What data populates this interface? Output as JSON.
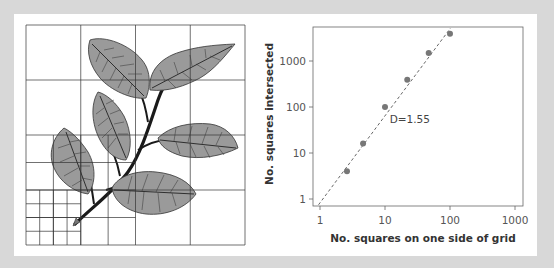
{
  "figure": {
    "frame_color": "#d8d8d8",
    "panel_color": "#ffffff"
  },
  "diagram": {
    "leaf_fill": "#9a9a9a",
    "grid": {
      "major_divisions": 4,
      "medium_region": "lower-left quadrant subdivided 4x4",
      "fine_region": "lower-left quarter of medium region subdivided 4x4"
    }
  },
  "chart_data": {
    "type": "scatter",
    "title": "",
    "xlabel": "No. squares on one side of grid",
    "ylabel": "No. squares intersected",
    "xscale": "log",
    "yscale": "log",
    "xlim": [
      0.8,
      1300
    ],
    "ylim": [
      0.7,
      5500
    ],
    "xticks": [
      1,
      10,
      100,
      1000
    ],
    "xtick_labels": [
      "1",
      "10",
      "100",
      "1000"
    ],
    "yticks": [
      1,
      10,
      100,
      1000
    ],
    "ytick_labels": [
      "1",
      "10",
      "100",
      "1000"
    ],
    "grid": false,
    "legend": null,
    "series": [
      {
        "name": "box counts",
        "x": [
          2.6,
          4.6,
          10,
          22,
          47,
          100
        ],
        "y": [
          4,
          16,
          100,
          390,
          1500,
          3900
        ],
        "marker": "circle",
        "color": "#777777"
      }
    ],
    "fit_line": {
      "style": "dashed",
      "color": "#555555",
      "slope": 1.55,
      "from": [
        0.95,
        0.75
      ],
      "to": [
        102,
        5200
      ]
    },
    "annotations": [
      {
        "text": "D=1.55",
        "x": 11,
        "y": 55
      }
    ]
  }
}
